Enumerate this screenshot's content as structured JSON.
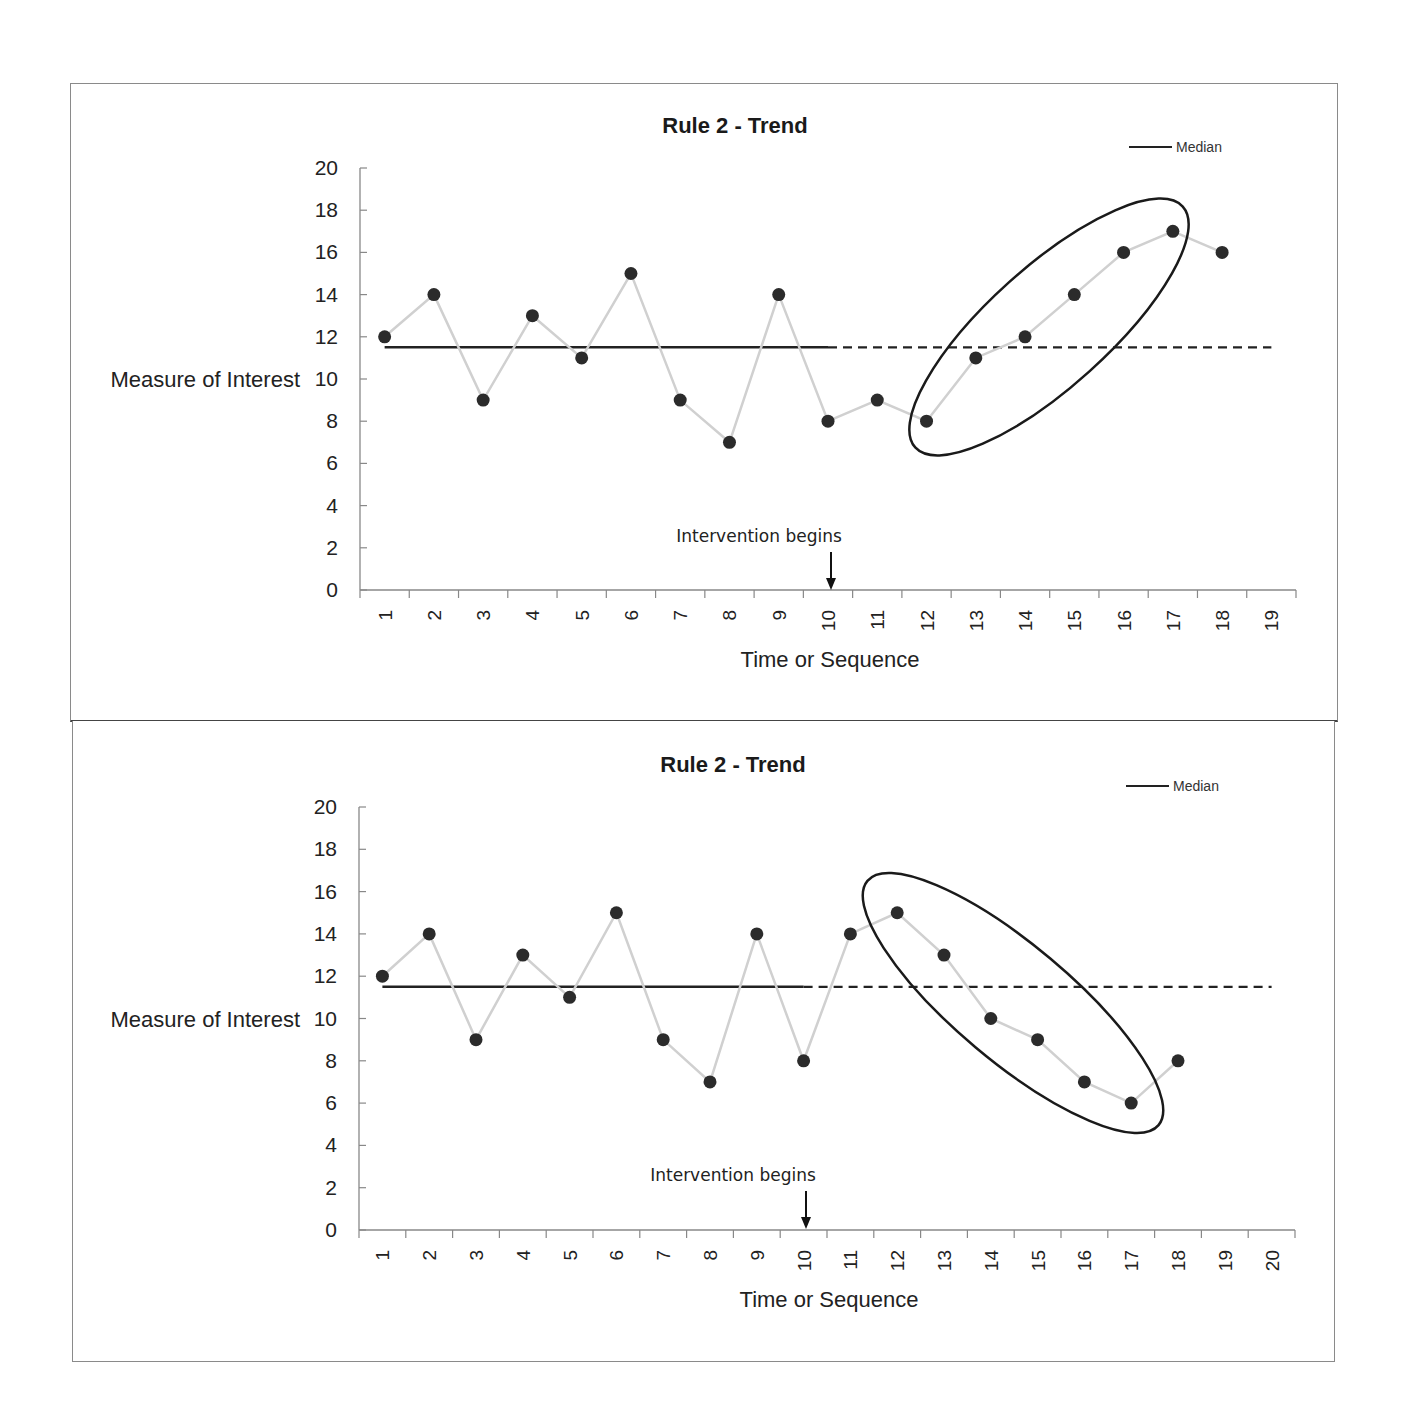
{
  "chart_data": [
    {
      "type": "line",
      "title": "Rule 2 - Trend",
      "xlabel": "Time or Sequence",
      "ylabel": "Measure of Interest",
      "ylim": [
        0,
        20
      ],
      "yticks": [
        0,
        2,
        4,
        6,
        8,
        10,
        12,
        14,
        16,
        18,
        20
      ],
      "categories": [
        "1",
        "2",
        "3",
        "4",
        "5",
        "6",
        "7",
        "8",
        "9",
        "10",
        "11",
        "12",
        "13",
        "14",
        "15",
        "16",
        "17",
        "18",
        "19"
      ],
      "series": [
        {
          "name": "Measure",
          "values": [
            12,
            14,
            9,
            13,
            11,
            15,
            9,
            7,
            14,
            8,
            9,
            8,
            11,
            12,
            14,
            16,
            17,
            16
          ],
          "color": "#d0d0d0",
          "marker_color": "#2b2b2b"
        },
        {
          "name": "Median",
          "value": 11.5,
          "solid_range": [
            1,
            10
          ],
          "dashed_range": [
            10,
            19
          ],
          "color": "#222222"
        }
      ],
      "legend": {
        "entries": [
          "Median"
        ],
        "position": "top-right"
      },
      "grid": false,
      "annotations": [
        {
          "text": "Intervention begins",
          "at_category": "10",
          "type": "arrow-down"
        },
        {
          "type": "ellipse",
          "around_categories": [
            "12",
            "13",
            "14",
            "15",
            "16",
            "17"
          ],
          "meaning": "upward trend"
        }
      ]
    },
    {
      "type": "line",
      "title": "Rule 2 - Trend",
      "xlabel": "Time or Sequence",
      "ylabel": "Measure of Interest",
      "ylim": [
        0,
        20
      ],
      "yticks": [
        0,
        2,
        4,
        6,
        8,
        10,
        12,
        14,
        16,
        18,
        20
      ],
      "categories": [
        "1",
        "2",
        "3",
        "4",
        "5",
        "6",
        "7",
        "8",
        "9",
        "10",
        "11",
        "12",
        "13",
        "14",
        "15",
        "16",
        "17",
        "18",
        "19",
        "20"
      ],
      "series": [
        {
          "name": "Measure",
          "values": [
            12,
            14,
            9,
            13,
            11,
            15,
            9,
            7,
            14,
            8,
            14,
            15,
            13,
            10,
            9,
            7,
            6,
            8
          ],
          "color": "#d0d0d0",
          "marker_color": "#2b2b2b"
        },
        {
          "name": "Median",
          "value": 11.5,
          "solid_range": [
            1,
            10
          ],
          "dashed_range": [
            10,
            20
          ],
          "color": "#222222"
        }
      ],
      "legend": {
        "entries": [
          "Median"
        ],
        "position": "top-right"
      },
      "grid": false,
      "annotations": [
        {
          "text": "Intervention begins",
          "at_category": "10",
          "type": "arrow-down"
        },
        {
          "type": "ellipse",
          "around_categories": [
            "12",
            "13",
            "14",
            "15",
            "16",
            "17"
          ],
          "meaning": "downward trend"
        }
      ]
    }
  ],
  "charts": [
    {
      "title": "Rule 2 - Trend",
      "ylabel": "Measure of Interest",
      "xlabel": "Time or Sequence",
      "legend_label": "Median",
      "annotation": "Intervention begins"
    },
    {
      "title": "Rule 2 - Trend",
      "ylabel": "Measure of Interest",
      "xlabel": "Time or Sequence",
      "legend_label": "Median",
      "annotation": "Intervention begins"
    }
  ]
}
